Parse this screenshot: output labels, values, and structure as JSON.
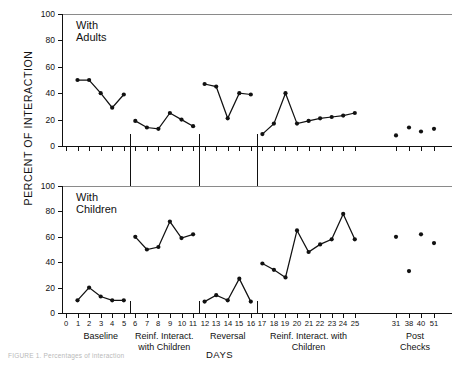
{
  "figure": {
    "ylabel": "PERCENT OF INTERACTION",
    "xlabel": "DAYS",
    "panel_top_title": "With Adults",
    "panel_bottom_title": "With Children",
    "caption": "FIGURE 1.  Percentages of interaction"
  },
  "axes": {
    "y_ticks": [
      "0",
      "20",
      "40",
      "60",
      "80",
      "100"
    ],
    "y_ticks_bottom": [
      "0",
      "20",
      "40",
      "60",
      "80",
      "100"
    ],
    "x_ticks": [
      "0",
      "1",
      "2",
      "3",
      "4",
      "5",
      "6",
      "7",
      "8",
      "9",
      "10",
      "11",
      "12",
      "13",
      "14",
      "15",
      "16",
      "17",
      "18",
      "19",
      "20",
      "21",
      "22",
      "23",
      "24",
      "25",
      "31",
      "38",
      "40",
      "51"
    ]
  },
  "phases": [
    {
      "label": "Baseline"
    },
    {
      "label": "Reinf. Interact.\nwith Children"
    },
    {
      "label": "Reversal"
    },
    {
      "label": "Reinf. Interact. with\nChildren"
    },
    {
      "label": "Post\nChecks"
    }
  ],
  "phase_labels": {
    "baseline": "Baseline",
    "reinf1_line1": "Reinf. Interact.",
    "reinf1_line2": "with Children",
    "reversal": "Reversal",
    "reinf2_line1": "Reinf. Interact. with",
    "reinf2_line2": "Children",
    "post_line1": "Post",
    "post_line2": "Checks"
  },
  "chart_data": [
    {
      "type": "line",
      "title": "With Adults",
      "xlabel": "DAYS",
      "ylabel": "PERCENT OF INTERACTION",
      "ylim": [
        0,
        100
      ],
      "grid": false,
      "legend": "none",
      "series": [
        {
          "name": "Baseline",
          "x": [
            1,
            2,
            3,
            4,
            5
          ],
          "values": [
            50,
            50,
            40,
            29,
            39
          ]
        },
        {
          "name": "Reinf. Interact. with Children",
          "x": [
            6,
            7,
            8,
            9,
            10,
            11
          ],
          "values": [
            19,
            14,
            13,
            25,
            20,
            15
          ]
        },
        {
          "name": "Reversal",
          "x": [
            12,
            13,
            14,
            15,
            16
          ],
          "values": [
            47,
            45,
            21,
            40,
            39
          ]
        },
        {
          "name": "Reinf. Interact. with Children 2",
          "x": [
            17,
            18,
            19,
            20,
            21,
            22,
            23,
            24,
            25
          ],
          "values": [
            9,
            17,
            40,
            17,
            19,
            21,
            22,
            23,
            25
          ]
        },
        {
          "name": "Post Checks",
          "x": [
            31,
            38,
            40,
            51
          ],
          "values": [
            8,
            14,
            11,
            13
          ],
          "style": "points-only"
        }
      ]
    },
    {
      "type": "line",
      "title": "With Children",
      "xlabel": "DAYS",
      "ylabel": "PERCENT OF INTERACTION",
      "ylim": [
        0,
        100
      ],
      "grid": false,
      "legend": "none",
      "series": [
        {
          "name": "Baseline",
          "x": [
            1,
            2,
            3,
            4,
            5
          ],
          "values": [
            10,
            20,
            13,
            10,
            10
          ]
        },
        {
          "name": "Reinf. Interact. with Children",
          "x": [
            6,
            7,
            8,
            9,
            10,
            11
          ],
          "values": [
            60,
            50,
            52,
            72,
            59,
            62
          ]
        },
        {
          "name": "Reversal",
          "x": [
            12,
            13,
            14,
            15,
            16
          ],
          "values": [
            9,
            14,
            10,
            27,
            9
          ]
        },
        {
          "name": "Reinf. Interact. with Children 2",
          "x": [
            17,
            18,
            19,
            20,
            21,
            22,
            23,
            24,
            25
          ],
          "values": [
            39,
            34,
            28,
            65,
            48,
            54,
            58,
            78,
            58
          ]
        },
        {
          "name": "Post Checks",
          "x": [
            31,
            38,
            40,
            51
          ],
          "values": [
            60,
            33,
            62,
            55
          ],
          "style": "points-only"
        }
      ]
    }
  ]
}
